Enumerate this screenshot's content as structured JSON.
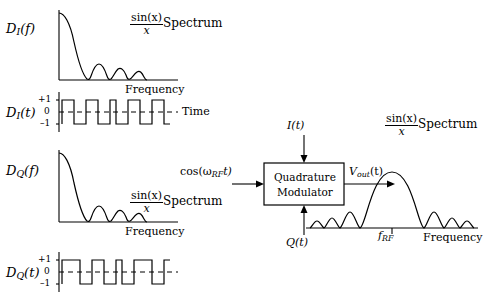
{
  "figure": {
    "title": "",
    "blocks": {
      "modulator_line1": "Quadrature",
      "modulator_line2": "Modulator"
    },
    "signals": {
      "i_input": "I(t)",
      "q_input": "Q(t)",
      "lo_input": "cos(ω",
      "lo_sub": "RF",
      "lo_tail": "t)",
      "v_out": "V",
      "v_out_sub": "out",
      "v_out_tail": "(t)"
    },
    "panels": [
      {
        "id": "di-spectrum",
        "y_label": "D",
        "y_label_sub": "I",
        "y_label_tail": "(f)",
        "x_axis_label": "Frequency",
        "annotation_num": "sin(x)",
        "annotation_den": "x",
        "annotation_text": "Spectrum"
      },
      {
        "id": "di-time",
        "y_label": "D",
        "y_label_sub": "I",
        "y_label_tail": "(t)",
        "x_axis_label": "Time",
        "y_ticks": [
          "+1",
          "0",
          "–1"
        ]
      },
      {
        "id": "dq-spectrum",
        "y_label": "D",
        "y_label_sub": "Q",
        "y_label_tail": "(f)",
        "x_axis_label": "Frequency",
        "annotation_num": "sin(x)",
        "annotation_den": "x",
        "annotation_text": "Spectrum"
      },
      {
        "id": "dq-time",
        "y_label": "D",
        "y_label_sub": "Q",
        "y_label_tail": "(t)",
        "x_axis_label": "Time",
        "y_ticks": [
          "+1",
          "0",
          "–1"
        ]
      },
      {
        "id": "output-spectrum",
        "x_axis_label": "Frequency",
        "center_tick": "f",
        "center_tick_sub": "RF",
        "annotation_num": "sin(x)",
        "annotation_den": "x",
        "annotation_text": "Spectrum"
      }
    ],
    "colors": {
      "line": "#000000",
      "background": "#ffffff"
    }
  }
}
